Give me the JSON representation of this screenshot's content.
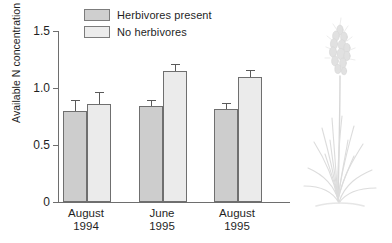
{
  "chart_data": {
    "type": "bar",
    "title": "",
    "subtitle": "",
    "xlabel": "",
    "ylabel": "Available N concentration (mg/kg soil)",
    "categories": [
      "August\n1994",
      "June\n1995",
      "August\n1995"
    ],
    "category_lines": [
      {
        "line1": "August",
        "line2": "1994"
      },
      {
        "line1": "June",
        "line2": "1995"
      },
      {
        "line1": "August",
        "line2": "1995"
      }
    ],
    "series": [
      {
        "name": "Herbivores present",
        "color": "#cdcdcd",
        "values": [
          0.8,
          0.845,
          0.815
        ],
        "errors": [
          0.09,
          0.045,
          0.045
        ]
      },
      {
        "name": "No herbivores",
        "color": "#ebebeb",
        "values": [
          0.86,
          1.145,
          1.095
        ],
        "errors": [
          0.1,
          0.055,
          0.05
        ]
      }
    ],
    "ylim": [
      0,
      1.5
    ],
    "yticks": [
      0,
      0.5,
      1.0,
      1.5
    ],
    "ytick_labels": [
      "0",
      "0.5",
      "1.0",
      "1.5"
    ],
    "grid": false,
    "legend_position": "top-left",
    "error_bar_type": "standard error",
    "bar_edge_color": "#6f6f6f",
    "axis_color": "#6e6e6e"
  },
  "legend": {
    "items": [
      {
        "label": "Herbivores present",
        "swatch": "dark"
      },
      {
        "label": "No herbivores",
        "swatch": "light"
      }
    ]
  },
  "illustration": {
    "name": "grass-plant-illustration",
    "description": "grass plant with seed head",
    "color": "#d8d8d8"
  }
}
